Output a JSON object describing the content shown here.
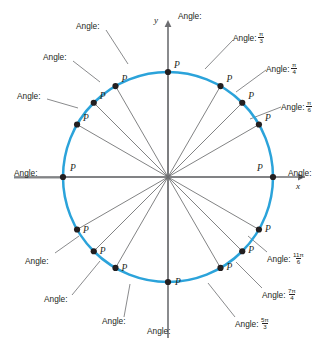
{
  "figure": {
    "type": "unit-circle-diagram",
    "center": {
      "x": 168,
      "y": 177
    },
    "radius": 105,
    "circle_color": "#2ba3da",
    "axis_color": "#6d6e71",
    "ray_color": "#58595b",
    "point_color": "#231f20",
    "text_color": "#231f20"
  },
  "axes": {
    "x_label": "x",
    "y_label": "y"
  },
  "point_label": "P",
  "angle_prefix": "Angle:",
  "chart_data": {
    "type": "scatter",
    "xlabel": "x",
    "ylabel": "y",
    "xlim": [
      -1.25,
      1.25
    ],
    "ylim": [
      -1.25,
      1.25
    ],
    "grid": false,
    "legend": null,
    "points": [
      {
        "id": "p0",
        "angle_deg": 0,
        "label": "P",
        "angle_text": "Angle:",
        "value_num": "",
        "value_den": "",
        "has_value": false
      },
      {
        "id": "p30",
        "angle_deg": 30,
        "label": "P",
        "angle_text": "Angle:",
        "value_num": "π",
        "value_den": "6",
        "has_value": true
      },
      {
        "id": "p45",
        "angle_deg": 45,
        "label": "P",
        "angle_text": "Angle:",
        "value_num": "π",
        "value_den": "4",
        "has_value": true
      },
      {
        "id": "p60",
        "angle_deg": 60,
        "label": "P",
        "angle_text": "Angle:",
        "value_num": "π",
        "value_den": "3",
        "has_value": true
      },
      {
        "id": "p90",
        "angle_deg": 90,
        "label": "P",
        "angle_text": "Angle:",
        "value_num": "",
        "value_den": "",
        "has_value": false
      },
      {
        "id": "p120",
        "angle_deg": 120,
        "label": "P",
        "angle_text": "Angle:",
        "value_num": "",
        "value_den": "",
        "has_value": false
      },
      {
        "id": "p135",
        "angle_deg": 135,
        "label": "P",
        "angle_text": "Angle:",
        "value_num": "",
        "value_den": "",
        "has_value": false
      },
      {
        "id": "p150",
        "angle_deg": 150,
        "label": "P",
        "angle_text": "Angle:",
        "value_num": "",
        "value_den": "",
        "has_value": false
      },
      {
        "id": "p180",
        "angle_deg": 180,
        "label": "P",
        "angle_text": "Angle:",
        "value_num": "",
        "value_den": "",
        "has_value": false
      },
      {
        "id": "p210",
        "angle_deg": 210,
        "label": "P",
        "angle_text": "Angle:",
        "value_num": "",
        "value_den": "",
        "has_value": false
      },
      {
        "id": "p225",
        "angle_deg": 225,
        "label": "P",
        "angle_text": "Angle:",
        "value_num": "",
        "value_den": "",
        "has_value": false
      },
      {
        "id": "p240",
        "angle_deg": 240,
        "label": "P",
        "angle_text": "Angle:",
        "value_num": "",
        "value_den": "",
        "has_value": false
      },
      {
        "id": "p270",
        "angle_deg": 270,
        "label": "P",
        "angle_text": "Angle:",
        "value_num": "",
        "value_den": "",
        "has_value": false
      },
      {
        "id": "p300",
        "angle_deg": 300,
        "label": "P",
        "angle_text": "Angle:",
        "value_num": "5π",
        "value_den": "3",
        "has_value": true
      },
      {
        "id": "p315",
        "angle_deg": 315,
        "label": "P",
        "angle_text": "Angle:",
        "value_num": "7π",
        "value_den": "4",
        "has_value": true
      },
      {
        "id": "p330",
        "angle_deg": 330,
        "label": "P",
        "angle_text": "Angle:",
        "value_num": "11π",
        "value_den": "6",
        "has_value": true
      }
    ]
  },
  "labels": [
    {
      "key": "a120",
      "text": "Angle:",
      "num": "",
      "den": "",
      "x": 76,
      "y": 22,
      "lead": [
        [
          106,
          30
        ],
        [
          128,
          64
        ]
      ]
    },
    {
      "key": "a135",
      "text": "Angle:",
      "num": "",
      "den": "",
      "x": 43,
      "y": 53,
      "lead": [
        [
          73,
          61
        ],
        [
          100,
          82
        ]
      ]
    },
    {
      "key": "a150",
      "text": "Angle:",
      "num": "",
      "den": "",
      "x": 17,
      "y": 92,
      "lead": [
        [
          47,
          99
        ],
        [
          78,
          108
        ]
      ]
    },
    {
      "key": "a90",
      "text": "Angle:",
      "num": "",
      "den": "",
      "x": 178,
      "y": 12,
      "lead": null
    },
    {
      "key": "a60",
      "text": "Angle:",
      "num": "π",
      "den": "3",
      "x": 233,
      "y": 31,
      "lead": [
        [
          233,
          40
        ],
        [
          205,
          69
        ]
      ]
    },
    {
      "key": "a45",
      "text": "Angle:",
      "num": "π",
      "den": "4",
      "x": 266,
      "y": 62,
      "lead": [
        [
          266,
          70
        ],
        [
          236,
          92
        ]
      ]
    },
    {
      "key": "a30",
      "text": "Angle:",
      "num": "π",
      "den": "6",
      "x": 281,
      "y": 100,
      "lead": [
        [
          281,
          107
        ],
        [
          250,
          119
        ]
      ]
    },
    {
      "key": "a180",
      "text": "Angle:",
      "num": "",
      "den": "",
      "x": 14,
      "y": 169,
      "lead": [
        [
          14,
          178
        ],
        [
          62,
          178
        ]
      ]
    },
    {
      "key": "a0",
      "text": "Angle:",
      "num": "",
      "den": "",
      "x": 288,
      "y": 169,
      "lead": null
    },
    {
      "key": "a330",
      "text": "Angle:",
      "num": "11π",
      "den": "6",
      "x": 267,
      "y": 252,
      "lead": [
        [
          267,
          252
        ],
        [
          248,
          236
        ]
      ]
    },
    {
      "key": "a315",
      "text": "Angle:",
      "num": "7π",
      "den": "4",
      "x": 262,
      "y": 288,
      "lead": [
        [
          262,
          288
        ],
        [
          236,
          262
        ]
      ]
    },
    {
      "key": "a300",
      "text": "Angle:",
      "num": "5π",
      "den": "3",
      "x": 235,
      "y": 317,
      "lead": [
        [
          235,
          317
        ],
        [
          208,
          283
        ]
      ]
    },
    {
      "key": "a270",
      "text": "Angle:",
      "num": "",
      "den": "",
      "x": 147,
      "y": 327,
      "lead": null
    },
    {
      "key": "a240",
      "text": "Angle:",
      "num": "",
      "den": "",
      "x": 102,
      "y": 317,
      "lead": [
        [
          124,
          317
        ],
        [
          130,
          284
        ]
      ]
    },
    {
      "key": "a225",
      "text": "Angle:",
      "num": "",
      "den": "",
      "x": 44,
      "y": 295,
      "lead": [
        [
          72,
          295
        ],
        [
          100,
          261
        ]
      ]
    },
    {
      "key": "a210",
      "text": "Angle:",
      "num": "",
      "den": "",
      "x": 25,
      "y": 257,
      "lead": [
        [
          55,
          253
        ],
        [
          79,
          236
        ]
      ]
    }
  ]
}
